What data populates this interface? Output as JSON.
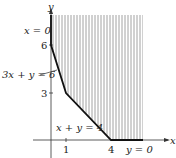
{
  "figure": {
    "type": "feasible-region",
    "axes": {
      "x_label": "x",
      "y_label": "y"
    },
    "ticks": {
      "x": [
        {
          "value": 1,
          "label": "1"
        },
        {
          "value": 4,
          "label": "4"
        }
      ],
      "y": [
        {
          "value": 3,
          "label": "3"
        },
        {
          "value": 6,
          "label": "6"
        }
      ]
    },
    "boundary_vertices": [
      [
        0,
        6
      ],
      [
        1,
        3
      ],
      [
        4,
        0
      ]
    ],
    "constraints": [
      {
        "label": "x = 0"
      },
      {
        "label": "3x + y = 6"
      },
      {
        "label": "x + y = 4"
      },
      {
        "label": "y = 0"
      }
    ],
    "region": {
      "fill": "vertical-hatch",
      "hatch_color": "#888888",
      "boundary_color": "#111111"
    }
  },
  "chart_data": {
    "type": "area",
    "title": "",
    "xlabel": "x",
    "ylabel": "y",
    "boundary": {
      "x": [
        0,
        1,
        4
      ],
      "y": [
        6,
        3,
        0
      ]
    },
    "x_ticks": [
      1,
      4
    ],
    "y_ticks": [
      3,
      6
    ],
    "annotations": [
      "x = 0",
      "3x + y = 6",
      "x + y = 4",
      "y = 0"
    ],
    "region": "unbounded, above boundary, x >= 0, y >= 0"
  }
}
